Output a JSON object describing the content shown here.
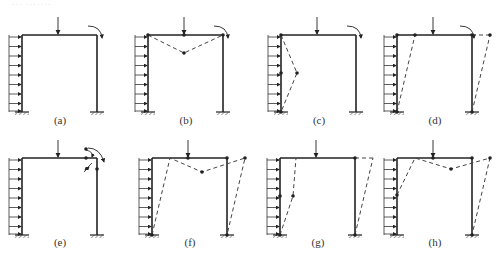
{
  "header": {
    "ghost_text": "··· ·······"
  },
  "figure": {
    "panels": [
      {
        "id": "a",
        "label": "(a)",
        "mechanism": "none",
        "description": "Loaded portal frame: distributed lateral load on left column, vertical point load at beam midspan, moment at top-right corner"
      },
      {
        "id": "b",
        "label": "(b)",
        "mechanism": "beam",
        "description": "Beam mechanism with hinges at both beam ends and under the point load"
      },
      {
        "id": "c",
        "label": "(c)",
        "mechanism": "left-column",
        "description": "Left column mechanism with hinges at top, mid-height and base of left column"
      },
      {
        "id": "d",
        "label": "(d)",
        "mechanism": "sway",
        "description": "Sway mechanism with hinges at column tops and bases"
      },
      {
        "id": "e",
        "label": "(e)",
        "mechanism": "joint",
        "description": "Joint rotation mechanism at top-right corner"
      },
      {
        "id": "f",
        "label": "(f)",
        "mechanism": "combined-beam-sway",
        "description": "Combined beam and sway mechanism"
      },
      {
        "id": "g",
        "label": "(g)",
        "mechanism": "combined-column-sway",
        "description": "Combined left column and sway mechanism"
      },
      {
        "id": "h",
        "label": "(h)",
        "mechanism": "combined-all",
        "description": "Combined column, beam and sway mechanism"
      }
    ]
  },
  "colors": {
    "line": "#222222",
    "dash": "#444444",
    "hatch": "#555555"
  }
}
